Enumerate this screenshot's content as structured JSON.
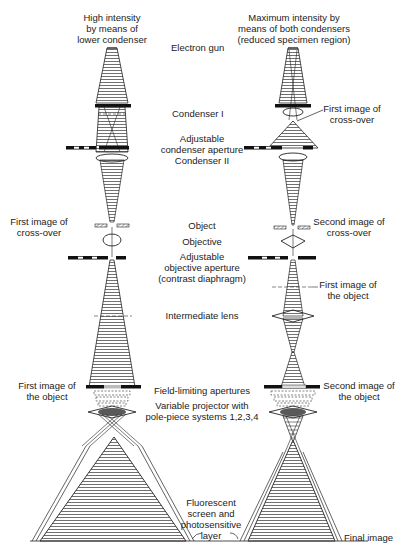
{
  "figure": {
    "colors": {
      "ink": "#222222",
      "background": "#ffffff",
      "hatch": "#555555"
    }
  },
  "columns": {
    "left": {
      "heading": [
        "High intensity",
        "by means of",
        "lower condenser"
      ]
    },
    "right": {
      "heading": [
        "Maximum intensity by",
        "means of both condensers",
        "(reduced specimen region)"
      ]
    }
  },
  "center_labels": {
    "electron_gun": "Electron gun",
    "condenser_1": "Condenser I",
    "adjustable_condenser_aperture": [
      "Adjustable",
      "condenser aperture",
      "Condenser II"
    ],
    "object": "Object",
    "objective": "Objective",
    "adjustable_objective_aperture": [
      "Adjustable",
      "objective aperture",
      "(contrast diaphragm)"
    ],
    "intermediate_lens": "Intermediate lens",
    "field_limiting_apertures": "Field-limiting apertures",
    "variable_projector": [
      "Variable projector with",
      "pole-piece systems 1,2,3,4"
    ],
    "fluorescent_screen": [
      "Fluorescent",
      "screen and",
      "photosensitive",
      "layer"
    ]
  },
  "side_labels": {
    "left_first_crossover": [
      "First image of",
      "cross-over"
    ],
    "left_first_object_image": [
      "First image of",
      "the object"
    ],
    "right_first_crossover": [
      "First image of",
      "cross-over"
    ],
    "right_second_crossover": [
      "Second image of",
      "cross-over"
    ],
    "right_first_object_image": [
      "First image of",
      "the object"
    ],
    "right_second_object_image": [
      "Second image of",
      "the object"
    ],
    "final_image": "Final image"
  }
}
